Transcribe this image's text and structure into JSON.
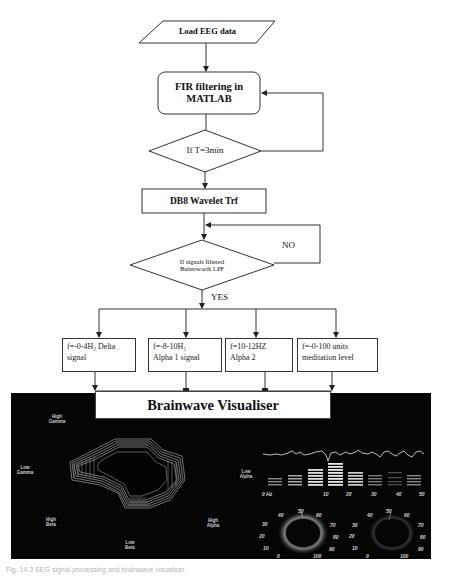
{
  "flowchart": {
    "start": {
      "label": "Load EEG data",
      "shape": "parallelogram"
    },
    "fir": {
      "line1": "FIR filtering in",
      "line2": "MATLAB",
      "shape": "rounded-rect"
    },
    "decision_time": {
      "label": "If T=3min",
      "shape": "diamond"
    },
    "wavelet": {
      "label": "DB8 Wavelet Trf",
      "shape": "rect"
    },
    "decision_filter": {
      "line1": "If signals filtered",
      "line2": "Butterworth LPF",
      "shape": "diamond"
    },
    "no_label": "NO",
    "yes_label": "YES",
    "outputs": [
      {
        "line1": "f=-0-4H₂ Delta",
        "line2": "signal"
      },
      {
        "line1": "f=-8-10H₂",
        "line2": "Alpha 1 signal"
      },
      {
        "line1": "f=10-12HZ",
        "line2": "Alpha 2"
      },
      {
        "line1": "f=-0-100 units",
        "line2": "meditation level"
      }
    ],
    "visualiser": {
      "label": "Brainwave Visualiser"
    }
  },
  "visualiser_panel": {
    "background": "#050505",
    "ring_labels": [
      {
        "line1": "High",
        "line2": "Gamma"
      },
      {
        "line1": "Low",
        "line2": "Gamma"
      },
      {
        "line1": "High",
        "line2": "Beta"
      },
      {
        "line1": "Low",
        "line2": "Beta"
      },
      {
        "line1": "High",
        "line2": "Alpha"
      }
    ],
    "spectrum": {
      "label_line1": "Low",
      "label_line2": "Alpha",
      "x_ticks": [
        "0 Hz",
        "10",
        "20",
        "30",
        "40",
        "50"
      ],
      "bar_levels": [
        3,
        4,
        6,
        8,
        5,
        4,
        3,
        4
      ]
    },
    "gauges": [
      {
        "ticks": [
          "0",
          "10",
          "20",
          "30",
          "40",
          "50",
          "60",
          "70",
          "80",
          "90",
          "100"
        ]
      },
      {
        "ticks": [
          "0",
          "10",
          "20",
          "30",
          "40",
          "50",
          "60",
          "70",
          "80",
          "90",
          "100"
        ]
      }
    ]
  },
  "caption": "Fig. 14.3  EEG signal processing and brainwave visualiser"
}
